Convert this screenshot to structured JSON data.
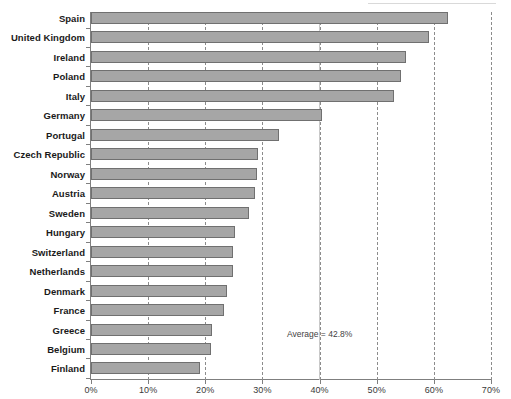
{
  "chart_data": {
    "type": "bar",
    "orientation": "horizontal",
    "title": "",
    "subtitle": "",
    "xlabel": "",
    "ylabel": "",
    "xlim": [
      0,
      70
    ],
    "xtick_labels": [
      "0%",
      "10%",
      "20%",
      "30%",
      "40%",
      "50%",
      "60%",
      "70%"
    ],
    "xtick_values": [
      0,
      10,
      20,
      30,
      40,
      50,
      60,
      70
    ],
    "grid": "vertical-dashed",
    "legend": "none",
    "value_unit": "%",
    "categories": [
      "Spain",
      "United Kingdom",
      "Ireland",
      "Poland",
      "Italy",
      "Germany",
      "Portugal",
      "Czech Republic",
      "Norway",
      "Austria",
      "Sweden",
      "Hungary",
      "Switzerland",
      "Netherlands",
      "Denmark",
      "France",
      "Greece",
      "Belgium",
      "Finland"
    ],
    "values": [
      62.5,
      59.2,
      55.2,
      54.2,
      53.0,
      40.4,
      32.9,
      29.3,
      29.0,
      28.7,
      27.7,
      25.2,
      24.9,
      24.9,
      23.8,
      23.3,
      21.2,
      21.0,
      19.1
    ],
    "annotations": [
      {
        "name": "average-label",
        "text": "Average = 42.8%",
        "value": 42.8,
        "x_percent": 45.5,
        "row_index": 16.3
      }
    ]
  }
}
